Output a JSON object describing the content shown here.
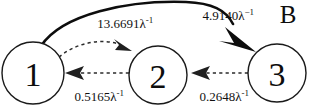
{
  "panel": {
    "letter": "B"
  },
  "diagram": {
    "type": "state-transition-graph",
    "nodes": [
      {
        "id": "1",
        "label": "1",
        "cx": 33,
        "cy": 73,
        "r": 31
      },
      {
        "id": "2",
        "label": "2",
        "cx": 158,
        "cy": 75,
        "r": 29
      },
      {
        "id": "3",
        "label": "3",
        "cx": 277,
        "cy": 73,
        "r": 29
      }
    ],
    "edges": [
      {
        "id": "edge-1-to-3",
        "from": "1",
        "to": "3",
        "style": "solid",
        "label": "4.9140λ",
        "label_exponent": "−1",
        "label_full": "4.9140λ⁻¹",
        "value": 4.914,
        "units": "λ^-1",
        "label_x": 225,
        "label_y": 20
      },
      {
        "id": "edge-1-to-2",
        "from": "1",
        "to": "2",
        "style": "dashed",
        "label": "13.6691λ",
        "label_exponent": "-1",
        "label_full": "13.6691λ⁻¹",
        "value": 13.6691,
        "units": "λ^-1",
        "label_x": 122,
        "label_y": 28
      },
      {
        "id": "edge-2-to-1",
        "from": "2",
        "to": "1",
        "style": "dashed",
        "label": "0.5165λ",
        "label_exponent": "-1",
        "label_full": "0.5165λ⁻¹",
        "value": 0.5165,
        "units": "λ^-1",
        "label_x": 96,
        "label_y": 101
      },
      {
        "id": "edge-3-to-2",
        "from": "3",
        "to": "2",
        "style": "dashed",
        "label": "0.2648λ",
        "label_exponent": "-1",
        "label_full": "0.2648λ⁻¹",
        "value": 0.2648,
        "units": "λ^-1",
        "label_x": 221,
        "label_y": 101
      }
    ]
  },
  "colors": {
    "stroke": "#1a1a1a",
    "solid_edge": "#0d0d0d",
    "dashed_edge": "#2b2b2b",
    "background": "#ffffff",
    "text": "#111111"
  }
}
